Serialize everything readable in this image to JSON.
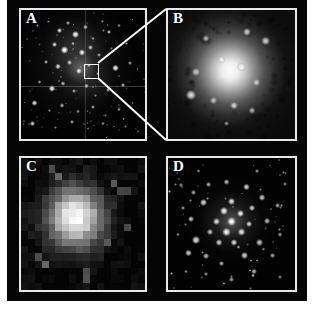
{
  "figure": {
    "background_color": "#ffffff",
    "plate_color": "#050505",
    "frame_color": "#e8e8e8",
    "callout_color": "#ffffff"
  },
  "panels": [
    {
      "id": "A",
      "label": "A",
      "name": "wide-field-star-field",
      "description": "Wide-field black-and-white image of a crowded star field with a compact bright knot near the centre, marked by a small white square; faint horizontal and vertical detector chip-gap lines cross the frame."
    },
    {
      "id": "B",
      "label": "B",
      "name": "zoomed-bright-core",
      "description": "Magnified view of the boxed region: a large diffuse bright object with a luminous centre, surrounded by mottled nebulosity and several embedded point sources."
    },
    {
      "id": "C",
      "label": "C",
      "name": "low-resolution-pixelated-view",
      "description": "Coarse, heavily pixelated grey-scale image of the same source showing a blocky bright core with a few isolated bright pixels elsewhere in the field."
    },
    {
      "id": "D",
      "label": "D",
      "name": "resolved-star-cluster",
      "description": "High-resolution image resolving the object into many individual point sources forming a compact cluster on a dark background."
    }
  ],
  "callout": {
    "name": "zoom-callout",
    "source_panel": "A",
    "target_panel": "B",
    "marker_shape": "square"
  },
  "chart_data": {
    "type": "heatmap",
    "title": "",
    "panel_labels": [
      "A",
      "B",
      "C",
      "D"
    ],
    "layout": "2x2 grid of astronomical grey-scale images",
    "colormap": "grayscale",
    "panel_A_stars": [
      {
        "x": 13,
        "y": 12,
        "r": 1.2,
        "i": 0.55
      },
      {
        "x": 22,
        "y": 9,
        "r": 1.0,
        "i": 0.45
      },
      {
        "x": 31,
        "y": 16,
        "r": 2.2,
        "i": 0.85
      },
      {
        "x": 38,
        "y": 10,
        "r": 1.4,
        "i": 0.6
      },
      {
        "x": 44,
        "y": 19,
        "r": 2.6,
        "i": 0.95
      },
      {
        "x": 52,
        "y": 13,
        "r": 1.6,
        "i": 0.7
      },
      {
        "x": 58,
        "y": 22,
        "r": 1.3,
        "i": 0.55
      },
      {
        "x": 66,
        "y": 9,
        "r": 1.1,
        "i": 0.5
      },
      {
        "x": 71,
        "y": 17,
        "r": 1.8,
        "i": 0.72
      },
      {
        "x": 79,
        "y": 12,
        "r": 1.2,
        "i": 0.5
      },
      {
        "x": 27,
        "y": 27,
        "r": 2.0,
        "i": 0.8
      },
      {
        "x": 35,
        "y": 31,
        "r": 2.8,
        "i": 1.0
      },
      {
        "x": 42,
        "y": 26,
        "r": 1.5,
        "i": 0.65
      },
      {
        "x": 49,
        "y": 33,
        "r": 2.4,
        "i": 0.9
      },
      {
        "x": 56,
        "y": 29,
        "r": 1.7,
        "i": 0.7
      },
      {
        "x": 63,
        "y": 35,
        "r": 1.3,
        "i": 0.55
      },
      {
        "x": 73,
        "y": 30,
        "r": 1.1,
        "i": 0.45
      },
      {
        "x": 85,
        "y": 26,
        "r": 1.4,
        "i": 0.6
      },
      {
        "x": 20,
        "y": 40,
        "r": 1.6,
        "i": 0.65
      },
      {
        "x": 30,
        "y": 44,
        "r": 2.1,
        "i": 0.82
      },
      {
        "x": 39,
        "y": 41,
        "r": 1.9,
        "i": 0.75
      },
      {
        "x": 47,
        "y": 47,
        "r": 2.3,
        "i": 0.88
      },
      {
        "x": 55,
        "y": 43,
        "r": 1.5,
        "i": 0.62
      },
      {
        "x": 62,
        "y": 49,
        "r": 1.2,
        "i": 0.5
      },
      {
        "x": 76,
        "y": 45,
        "r": 2.6,
        "i": 0.92
      },
      {
        "x": 88,
        "y": 41,
        "r": 1.3,
        "i": 0.55
      },
      {
        "x": 15,
        "y": 56,
        "r": 1.4,
        "i": 0.6
      },
      {
        "x": 25,
        "y": 61,
        "r": 2.5,
        "i": 0.9
      },
      {
        "x": 34,
        "y": 57,
        "r": 1.7,
        "i": 0.68
      },
      {
        "x": 43,
        "y": 63,
        "r": 1.5,
        "i": 0.6
      },
      {
        "x": 53,
        "y": 59,
        "r": 1.8,
        "i": 0.72
      },
      {
        "x": 60,
        "y": 66,
        "r": 1.2,
        "i": 0.5
      },
      {
        "x": 70,
        "y": 62,
        "r": 1.4,
        "i": 0.58
      },
      {
        "x": 82,
        "y": 58,
        "r": 1.6,
        "i": 0.66
      },
      {
        "x": 11,
        "y": 72,
        "r": 2.2,
        "i": 0.84
      },
      {
        "x": 23,
        "y": 78,
        "r": 1.3,
        "i": 0.55
      },
      {
        "x": 33,
        "y": 74,
        "r": 1.6,
        "i": 0.64
      },
      {
        "x": 46,
        "y": 79,
        "r": 1.2,
        "i": 0.5
      },
      {
        "x": 58,
        "y": 75,
        "r": 1.5,
        "i": 0.62
      },
      {
        "x": 68,
        "y": 82,
        "r": 1.1,
        "i": 0.45
      },
      {
        "x": 79,
        "y": 77,
        "r": 1.3,
        "i": 0.55
      },
      {
        "x": 90,
        "y": 72,
        "r": 1.0,
        "i": 0.42
      },
      {
        "x": 9,
        "y": 88,
        "r": 2.0,
        "i": 0.78
      },
      {
        "x": 28,
        "y": 91,
        "r": 1.2,
        "i": 0.5
      },
      {
        "x": 41,
        "y": 87,
        "r": 1.4,
        "i": 0.58
      },
      {
        "x": 54,
        "y": 92,
        "r": 1.1,
        "i": 0.45
      },
      {
        "x": 66,
        "y": 88,
        "r": 1.3,
        "i": 0.54
      },
      {
        "x": 84,
        "y": 90,
        "r": 1.2,
        "i": 0.48
      }
    ],
    "panel_B_knots": [
      {
        "x": 30,
        "y": 22,
        "r": 3.0,
        "i": 0.7
      },
      {
        "x": 62,
        "y": 17,
        "r": 3.6,
        "i": 0.85
      },
      {
        "x": 77,
        "y": 24,
        "r": 4.0,
        "i": 0.9
      },
      {
        "x": 22,
        "y": 48,
        "r": 3.4,
        "i": 0.75
      },
      {
        "x": 42,
        "y": 38,
        "r": 3.2,
        "i": 0.8
      },
      {
        "x": 58,
        "y": 44,
        "r": 3.8,
        "i": 0.88
      },
      {
        "x": 70,
        "y": 56,
        "r": 3.2,
        "i": 0.78
      },
      {
        "x": 18,
        "y": 66,
        "r": 4.4,
        "i": 0.95
      },
      {
        "x": 36,
        "y": 70,
        "r": 3.0,
        "i": 0.72
      },
      {
        "x": 52,
        "y": 74,
        "r": 3.6,
        "i": 0.85
      },
      {
        "x": 66,
        "y": 78,
        "r": 3.0,
        "i": 0.7
      },
      {
        "x": 46,
        "y": 88,
        "r": 2.6,
        "i": 0.6
      }
    ],
    "panel_C_pixels": "18x18 coarse grid, peak brightness near centre-left of frame",
    "panel_D_stars": [
      {
        "x": 50,
        "y": 48,
        "r": 4.0,
        "i": 1.0
      },
      {
        "x": 44,
        "y": 40,
        "r": 3.4,
        "i": 0.92
      },
      {
        "x": 57,
        "y": 42,
        "r": 3.2,
        "i": 0.9
      },
      {
        "x": 46,
        "y": 56,
        "r": 3.6,
        "i": 0.95
      },
      {
        "x": 58,
        "y": 56,
        "r": 3.0,
        "i": 0.86
      },
      {
        "x": 38,
        "y": 48,
        "r": 2.8,
        "i": 0.82
      },
      {
        "x": 64,
        "y": 50,
        "r": 2.6,
        "i": 0.8
      },
      {
        "x": 50,
        "y": 33,
        "r": 3.0,
        "i": 0.85
      },
      {
        "x": 52,
        "y": 64,
        "r": 2.8,
        "i": 0.82
      },
      {
        "x": 40,
        "y": 64,
        "r": 2.6,
        "i": 0.78
      },
      {
        "x": 33,
        "y": 56,
        "r": 2.4,
        "i": 0.74
      },
      {
        "x": 66,
        "y": 38,
        "r": 2.6,
        "i": 0.78
      },
      {
        "x": 28,
        "y": 34,
        "r": 3.0,
        "i": 0.8
      },
      {
        "x": 18,
        "y": 46,
        "r": 2.6,
        "i": 0.72
      },
      {
        "x": 22,
        "y": 62,
        "r": 3.2,
        "i": 0.84
      },
      {
        "x": 16,
        "y": 72,
        "r": 2.8,
        "i": 0.76
      },
      {
        "x": 30,
        "y": 74,
        "r": 2.4,
        "i": 0.7
      },
      {
        "x": 42,
        "y": 80,
        "r": 2.2,
        "i": 0.66
      },
      {
        "x": 60,
        "y": 74,
        "r": 2.8,
        "i": 0.78
      },
      {
        "x": 72,
        "y": 64,
        "r": 2.6,
        "i": 0.74
      },
      {
        "x": 78,
        "y": 48,
        "r": 2.4,
        "i": 0.7
      },
      {
        "x": 74,
        "y": 30,
        "r": 2.6,
        "i": 0.74
      },
      {
        "x": 62,
        "y": 22,
        "r": 2.8,
        "i": 0.78
      },
      {
        "x": 46,
        "y": 18,
        "r": 2.4,
        "i": 0.7
      },
      {
        "x": 32,
        "y": 20,
        "r": 2.2,
        "i": 0.66
      },
      {
        "x": 20,
        "y": 26,
        "r": 2.0,
        "i": 0.62
      },
      {
        "x": 12,
        "y": 38,
        "r": 1.8,
        "i": 0.58
      },
      {
        "x": 86,
        "y": 36,
        "r": 2.0,
        "i": 0.62
      },
      {
        "x": 88,
        "y": 58,
        "r": 1.8,
        "i": 0.58
      },
      {
        "x": 82,
        "y": 74,
        "r": 2.2,
        "i": 0.64
      },
      {
        "x": 68,
        "y": 86,
        "r": 2.4,
        "i": 0.68
      },
      {
        "x": 50,
        "y": 92,
        "r": 2.0,
        "i": 0.6
      },
      {
        "x": 30,
        "y": 88,
        "r": 1.8,
        "i": 0.56
      },
      {
        "x": 14,
        "y": 86,
        "r": 1.6,
        "i": 0.52
      },
      {
        "x": 8,
        "y": 58,
        "r": 1.6,
        "i": 0.5
      },
      {
        "x": 92,
        "y": 20,
        "r": 1.6,
        "i": 0.5
      },
      {
        "x": 24,
        "y": 10,
        "r": 1.6,
        "i": 0.52
      },
      {
        "x": 70,
        "y": 10,
        "r": 1.8,
        "i": 0.56
      },
      {
        "x": 88,
        "y": 90,
        "r": 1.6,
        "i": 0.5
      },
      {
        "x": 6,
        "y": 20,
        "r": 1.4,
        "i": 0.46
      }
    ]
  }
}
